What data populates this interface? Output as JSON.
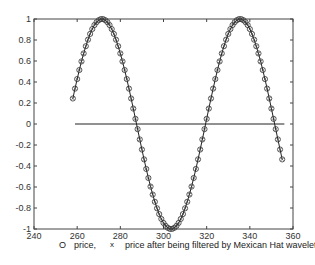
{
  "chart_data": {
    "type": "line",
    "title": "",
    "xlabel": "",
    "ylabel": "",
    "xlim": [
      240,
      360
    ],
    "ylim": [
      -1,
      1
    ],
    "grid": false,
    "x_ticks": [
      240,
      260,
      280,
      300,
      320,
      340,
      360
    ],
    "y_ticks": [
      -1,
      -0.8,
      -0.6,
      -0.4,
      -0.2,
      0,
      0.2,
      0.4,
      0.6,
      0.8,
      1
    ],
    "x_tick_labels": [
      "240",
      "260",
      "280",
      "300",
      "320",
      "340",
      "360"
    ],
    "y_tick_labels": [
      "-1",
      "-0.8",
      "-0.6",
      "-0.4",
      "-0.2",
      "0",
      "0.2",
      "0.4",
      "0.6",
      "0.8",
      "1"
    ],
    "legend_position": "bottom",
    "series": [
      {
        "name": "price",
        "marker": "o",
        "x_start": 258,
        "x_step": 1,
        "values": [
          0.243,
          0.337,
          0.428,
          0.514,
          0.596,
          0.672,
          0.741,
          0.803,
          0.858,
          0.904,
          0.942,
          0.97,
          0.989,
          0.999,
          0.999,
          0.989,
          0.97,
          0.942,
          0.904,
          0.858,
          0.803,
          0.741,
          0.672,
          0.596,
          0.514,
          0.428,
          0.337,
          0.243,
          0.147,
          0.049,
          -0.049,
          -0.147,
          -0.243,
          -0.337,
          -0.428,
          -0.514,
          -0.596,
          -0.672,
          -0.741,
          -0.803,
          -0.858,
          -0.904,
          -0.942,
          -0.97,
          -0.989,
          -0.999,
          -0.999,
          -0.989,
          -0.97,
          -0.942,
          -0.904,
          -0.858,
          -0.803,
          -0.741,
          -0.672,
          -0.596,
          -0.514,
          -0.428,
          -0.337,
          -0.243,
          -0.147,
          -0.049,
          0.049,
          0.147,
          0.243,
          0.337,
          0.428,
          0.514,
          0.596,
          0.672,
          0.741,
          0.803,
          0.858,
          0.904,
          0.942,
          0.97,
          0.989,
          0.999,
          0.999,
          0.989,
          0.97,
          0.942,
          0.904,
          0.858,
          0.803,
          0.741,
          0.672,
          0.596,
          0.514,
          0.428,
          0.337,
          0.243,
          0.147,
          0.049,
          -0.049,
          -0.147,
          -0.243,
          -0.337
        ]
      },
      {
        "name": "price after being filtered by Mexican Hat wavelet",
        "marker": "x",
        "x_start": 258,
        "x_step": 1,
        "values": [
          0.243,
          0.337,
          0.428,
          0.514,
          0.596,
          0.672,
          0.741,
          0.803,
          0.858,
          0.904,
          0.942,
          0.97,
          0.989,
          0.999,
          0.999,
          0.989,
          0.97,
          0.942,
          0.904,
          0.858,
          0.803,
          0.741,
          0.672,
          0.596,
          0.514,
          0.428,
          0.337,
          0.243,
          0.147,
          0.049,
          -0.049,
          -0.147,
          -0.243,
          -0.337,
          -0.428,
          -0.514,
          -0.596,
          -0.672,
          -0.741,
          -0.803,
          -0.858,
          -0.904,
          -0.942,
          -0.97,
          -0.989,
          -0.999,
          -0.999,
          -0.989,
          -0.97,
          -0.942,
          -0.904,
          -0.858,
          -0.803,
          -0.741,
          -0.672,
          -0.596,
          -0.514,
          -0.428,
          -0.337,
          -0.243,
          -0.147,
          -0.049,
          0.049,
          0.147,
          0.243,
          0.337,
          0.428,
          0.514,
          0.596,
          0.672,
          0.741,
          0.803,
          0.858,
          0.904,
          0.942,
          0.97,
          0.989,
          0.999,
          0.999,
          0.989,
          0.97,
          0.942,
          0.904,
          0.858,
          0.803,
          0.741,
          0.672,
          0.596,
          0.514,
          0.428,
          0.337,
          0.243,
          0.147,
          0.049,
          -0.049,
          -0.147,
          -0.243,
          -0.337
        ]
      },
      {
        "name": "zero line",
        "type": "hline",
        "y": 0,
        "x_range": [
          259,
          356
        ]
      }
    ]
  },
  "legend": {
    "marker1": "O",
    "label1": "price,",
    "marker2": "x",
    "label2": "price after being filtered by Mexican Hat wavelet"
  },
  "colors": {
    "axes": "#444444",
    "line": "#222222",
    "marker": "#333333"
  }
}
